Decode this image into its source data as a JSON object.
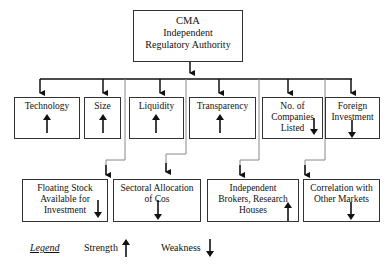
{
  "root": {
    "lines": [
      "CMA",
      "Independent",
      "Regulatory Authority"
    ]
  },
  "factors_row1": [
    {
      "label": "Technology",
      "type": "strength"
    },
    {
      "label": "Size",
      "type": "strength"
    },
    {
      "label": "Liquidity",
      "type": "strength"
    },
    {
      "label": "Transparency",
      "type": "strength"
    },
    {
      "label": "No. of Companies Listed",
      "type": "weakness"
    },
    {
      "label": "Foreign Investment",
      "type": "weakness"
    }
  ],
  "factors_row2": [
    {
      "label": "Floating Stock Available for Investment",
      "type": "weakness"
    },
    {
      "label": "Sectoral Allocation of Cos",
      "type": "weakness"
    },
    {
      "label": "Independent Brokers, Research Houses",
      "type": "strength"
    },
    {
      "label": "Correlation with Other Markets",
      "type": "weakness"
    }
  ],
  "legend": {
    "title": "Legend",
    "strength": "Strength",
    "weakness": "Weakness"
  },
  "colors": {
    "border": "#333333",
    "connector": "#888888",
    "arrow": "#111111"
  }
}
